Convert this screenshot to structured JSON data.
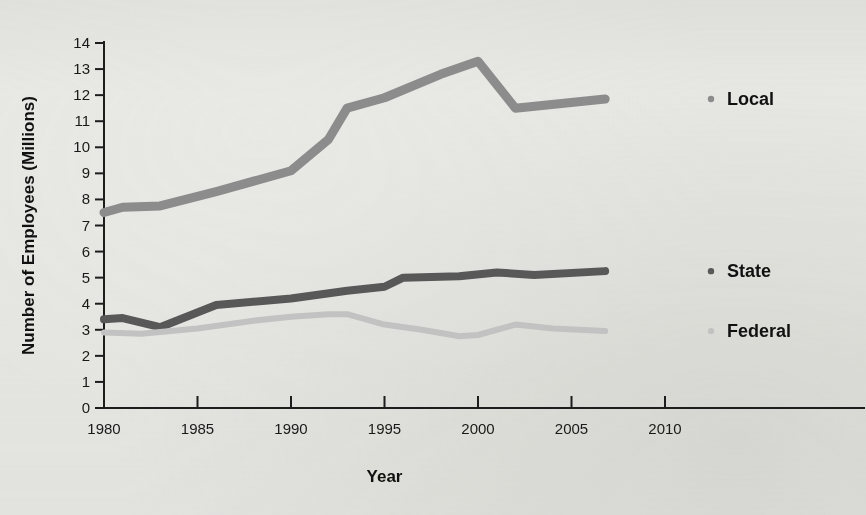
{
  "chart_data": {
    "type": "line",
    "title": "",
    "xlabel": "Year",
    "ylabel": "Number of Employees (Millions)",
    "xlim": [
      1980,
      2010
    ],
    "ylim": [
      0,
      14
    ],
    "grid": false,
    "legend_position": "right",
    "xticks": [
      "1980",
      "1985",
      "1990",
      "1995",
      "2000",
      "2005",
      "2010"
    ],
    "yticks": [
      "0",
      "1",
      "2",
      "3",
      "4",
      "5",
      "6",
      "7",
      "8",
      "9",
      "10",
      "11",
      "12",
      "13",
      "14"
    ],
    "series": [
      {
        "name": "Local",
        "color": "#8c8c8c",
        "x": [
          1980,
          1981,
          1983,
          1986,
          1990,
          1992,
          1993,
          1995,
          1998,
          2000,
          2002,
          2006.8
        ],
        "values": [
          7.5,
          7.7,
          7.75,
          8.3,
          9.1,
          10.3,
          11.5,
          11.9,
          12.8,
          13.3,
          11.5,
          11.85
        ]
      },
      {
        "name": "State",
        "color": "#585858",
        "x": [
          1980,
          1981,
          1983,
          1986,
          1990,
          1993,
          1995,
          1996,
          1999,
          2001,
          2003,
          2006.8
        ],
        "values": [
          3.4,
          3.45,
          3.1,
          3.95,
          4.2,
          4.5,
          4.65,
          5.0,
          5.05,
          5.2,
          5.1,
          5.25
        ]
      },
      {
        "name": "Federal",
        "color": "#c2c2c2",
        "x": [
          1980,
          1982,
          1985,
          1988,
          1990,
          1992,
          1993,
          1995,
          1997,
          1999,
          2000,
          2002,
          2004,
          2006.8
        ],
        "values": [
          2.9,
          2.85,
          3.05,
          3.35,
          3.5,
          3.6,
          3.6,
          3.2,
          3.0,
          2.75,
          2.8,
          3.2,
          3.05,
          2.95
        ]
      }
    ]
  },
  "legend": {
    "items": [
      {
        "label": "Local",
        "marker_color": "#8c8c8c",
        "y_value": 11.85
      },
      {
        "label": "State",
        "marker_color": "#585858",
        "y_value": 5.25
      },
      {
        "label": "Federal",
        "marker_color": "#c2c2c2",
        "y_value": 2.95
      }
    ]
  },
  "axes": {
    "x_title": "Year",
    "y_title": "Number of Employees (Millions)"
  }
}
